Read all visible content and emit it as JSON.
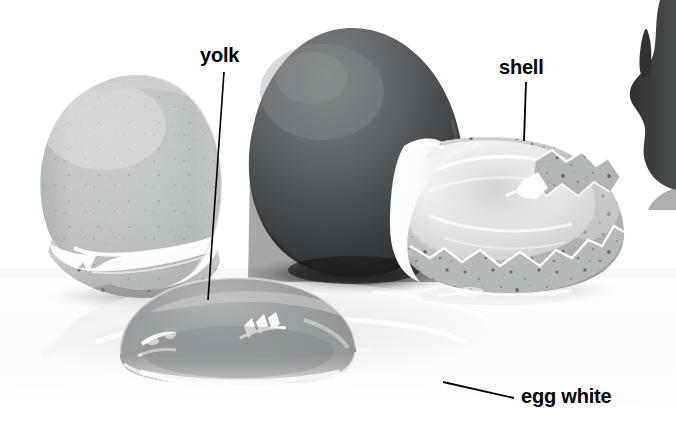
{
  "figure": {
    "kind": "labeled-photograph",
    "background_color": "#ffffff",
    "width": 676,
    "height": 435,
    "color_mode": "grayscale"
  },
  "labels": [
    {
      "id": "yolk",
      "text": "yolk",
      "x": 200,
      "y": 45,
      "color": "#000000",
      "leader": {
        "x1": 224,
        "y1": 72,
        "x2": 208,
        "y2": 300
      }
    },
    {
      "id": "shell",
      "text": "shell",
      "x": 499,
      "y": 57,
      "color": "#000000",
      "leader": {
        "x1": 526,
        "y1": 82,
        "x2": 524,
        "y2": 141
      }
    },
    {
      "id": "egg-white",
      "text": "egg white",
      "x": 521,
      "y": 386,
      "color": "#000000",
      "leader": {
        "x1": 443,
        "y1": 382,
        "x2": 514,
        "y2": 398
      }
    }
  ],
  "subjects": [
    {
      "id": "left-shell-half",
      "name": "left eggshell half",
      "description": "pale gray broken half-shell standing upright, bright white torn rim, speckled lower wall",
      "tone": "#b9bcbd"
    },
    {
      "id": "whole-egg",
      "name": "whole dark egg",
      "description": "intact egg in the centre, dark charcoal gray, lighter toward the top, dark contact shadow beneath",
      "tone": "#55585a"
    },
    {
      "id": "right-shell-half",
      "name": "right eggshell half",
      "description": "cracked half-shell lying open, glossy white inner membrane with jagged speckled broken edge",
      "tone": "#c6c8c8"
    },
    {
      "id": "yolk-dome",
      "name": "yolk",
      "description": "glossy gray dome of yolk resting in front, specular highlights on its surface",
      "tone": "#8e9193"
    },
    {
      "id": "egg-white-pool",
      "name": "egg white",
      "description": "thin translucent pool of albumen spreading across the white surface",
      "tone": "#eceeee"
    },
    {
      "id": "right-edge-object",
      "name": "dark object at right edge",
      "description": "cropped dark silhouette entering the frame at the upper right corner",
      "tone": "#3a3c3d"
    }
  ]
}
